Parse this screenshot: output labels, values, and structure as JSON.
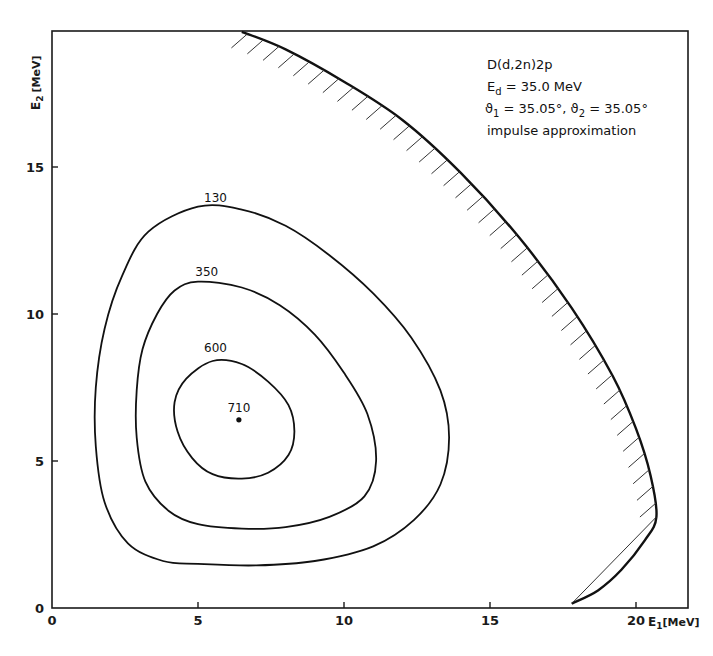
{
  "chart_data": {
    "type": "contour",
    "title": "",
    "xlabel": "E1 [MeV]",
    "xlabel_main": "E",
    "xlabel_sub": "1",
    "xlabel_unit": "[MeV]",
    "ylabel": "E2 [MeV]",
    "ylabel_main": "E",
    "ylabel_sub": "2",
    "ylabel_unit": "[MeV]",
    "xlim": [
      0,
      22.3
    ],
    "ylim": [
      0,
      19.6
    ],
    "x_ticks": [
      0,
      5,
      10,
      15,
      20
    ],
    "x_tick_labels": [
      "0",
      "5",
      "10",
      "15",
      "20"
    ],
    "y_ticks": [
      0,
      5,
      10,
      15
    ],
    "y_tick_labels": [
      "0",
      "5",
      "10",
      "15"
    ],
    "grid": false,
    "annotations": [
      {
        "text": "D(d,2n)2p"
      },
      {
        "main": "E",
        "sub": "d",
        "rest": " = 35.0 MeV"
      },
      {
        "sym1": "ϑ",
        "sub1": "1",
        "rest1": " = 35.05°, ",
        "sym2": "ϑ",
        "sub2": "2",
        "rest2": " = 35.05°"
      },
      {
        "text": "impulse approximation"
      }
    ],
    "annotation_placement": "top-right",
    "contours": [
      {
        "level": "130",
        "label_at": [
          5.6,
          13.7
        ],
        "points": [
          [
            5.0,
            13.65
          ],
          [
            6.5,
            13.55
          ],
          [
            8.0,
            13.0
          ],
          [
            9.5,
            12.0
          ],
          [
            11.0,
            10.7
          ],
          [
            12.3,
            9.2
          ],
          [
            13.3,
            7.4
          ],
          [
            13.6,
            5.8
          ],
          [
            13.3,
            4.2
          ],
          [
            12.4,
            3.0
          ],
          [
            11.0,
            2.1
          ],
          [
            9.0,
            1.6
          ],
          [
            7.0,
            1.45
          ],
          [
            5.0,
            1.5
          ],
          [
            3.8,
            1.6
          ],
          [
            2.6,
            2.2
          ],
          [
            1.8,
            3.6
          ],
          [
            1.5,
            5.5
          ],
          [
            1.5,
            7.5
          ],
          [
            1.8,
            9.5
          ],
          [
            2.4,
            11.3
          ],
          [
            3.3,
            12.8
          ]
        ]
      },
      {
        "level": "350",
        "label_at": [
          5.3,
          11.2
        ],
        "points": [
          [
            5.0,
            11.1
          ],
          [
            6.5,
            10.9
          ],
          [
            7.8,
            10.3
          ],
          [
            9.0,
            9.3
          ],
          [
            10.0,
            8.0
          ],
          [
            10.8,
            6.6
          ],
          [
            11.1,
            5.0
          ],
          [
            10.7,
            3.8
          ],
          [
            9.5,
            3.1
          ],
          [
            8.0,
            2.75
          ],
          [
            6.5,
            2.7
          ],
          [
            5.0,
            2.85
          ],
          [
            4.0,
            3.3
          ],
          [
            3.2,
            4.3
          ],
          [
            2.9,
            5.8
          ],
          [
            2.9,
            7.4
          ],
          [
            3.1,
            8.8
          ],
          [
            3.6,
            10.0
          ],
          [
            4.2,
            10.8
          ]
        ]
      },
      {
        "level": "600",
        "label_at": [
          5.6,
          8.6
        ],
        "points": [
          [
            5.5,
            8.4
          ],
          [
            6.5,
            8.3
          ],
          [
            7.4,
            7.7
          ],
          [
            8.1,
            6.9
          ],
          [
            8.3,
            6.0
          ],
          [
            8.1,
            5.2
          ],
          [
            7.4,
            4.6
          ],
          [
            6.5,
            4.4
          ],
          [
            5.5,
            4.55
          ],
          [
            4.8,
            5.1
          ],
          [
            4.3,
            6.0
          ],
          [
            4.2,
            7.0
          ],
          [
            4.6,
            7.8
          ]
        ]
      }
    ],
    "maximum": {
      "level": "710",
      "x": 6.4,
      "y": 6.4
    },
    "kinematic_boundary": {
      "points": [
        [
          6.5,
          19.6
        ],
        [
          8.0,
          19.0
        ],
        [
          10.0,
          17.9
        ],
        [
          12.0,
          16.6
        ],
        [
          14.0,
          14.8
        ],
        [
          16.0,
          12.6
        ],
        [
          17.8,
          10.2
        ],
        [
          19.2,
          7.9
        ],
        [
          20.0,
          6.1
        ],
        [
          20.5,
          4.5
        ],
        [
          20.7,
          3.1
        ],
        [
          20.3,
          2.3
        ],
        [
          19.5,
          1.3
        ],
        [
          18.7,
          0.6
        ],
        [
          17.8,
          0.15
        ]
      ],
      "hatched_side": "inside",
      "chord": [
        [
          17.8,
          0.15
        ],
        [
          20.7,
          3.1
        ]
      ]
    }
  }
}
